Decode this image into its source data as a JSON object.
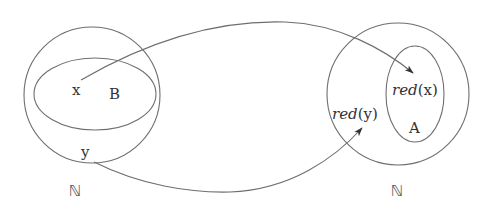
{
  "diagram": {
    "type": "set-mapping",
    "left_set": {
      "universe_label": "ℕ",
      "subset_label": "B",
      "elements": {
        "x": "x",
        "y": "y"
      }
    },
    "right_set": {
      "universe_label": "ℕ",
      "subset_label": "A",
      "images": {
        "red_x_func": "red",
        "red_x_arg": "(x)",
        "red_y_func": "red",
        "red_y_arg": "(y)"
      }
    },
    "arrows": [
      {
        "from": "x",
        "to": "red(x)"
      },
      {
        "from": "y",
        "to": "red(y)"
      }
    ],
    "colors": {
      "stroke": "#6e6e6e",
      "text": "#333333"
    }
  }
}
